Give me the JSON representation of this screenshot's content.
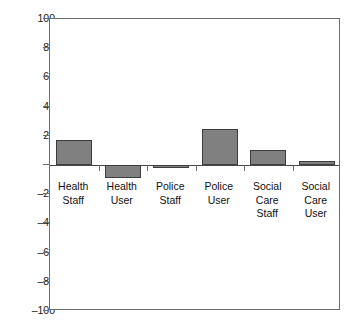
{
  "chart_data": {
    "type": "bar",
    "title": "",
    "subtitle": "",
    "xlabel": "",
    "ylabel": "",
    "categories": [
      "Health Staff",
      "Health User",
      "Police Staff",
      "Police User",
      "Social Care Staff",
      "Social Care User"
    ],
    "category_lines": [
      [
        "Health",
        "Staff"
      ],
      [
        "Health",
        "User"
      ],
      [
        "Police",
        "Staff"
      ],
      [
        "Police",
        "User"
      ],
      [
        "Social",
        "Care",
        "Staff"
      ],
      [
        "Social",
        "Care",
        "User"
      ]
    ],
    "values": [
      17,
      -9,
      -2,
      25,
      10,
      3
    ],
    "ylim": [
      -100,
      100
    ],
    "yticks": [
      100,
      80,
      60,
      40,
      20,
      0,
      -20,
      -40,
      -60,
      -80,
      -100
    ],
    "ytick_labels": [
      "100",
      "80",
      "60",
      "40",
      "20",
      "0",
      "–20",
      "–40",
      "–60",
      "–80",
      "–100"
    ],
    "grid": false,
    "legend": false,
    "legend_position": "none",
    "series": [
      {
        "name": "",
        "values": [
          17,
          -9,
          -2,
          25,
          10,
          3
        ]
      }
    ]
  },
  "style": {
    "bar_fill": "#808080",
    "bar_border": "#3d3d3d",
    "axis_color": "#6e6e6e",
    "zero_line_color": "#4a4a4a",
    "text_color": "#111111",
    "background": "#ffffff"
  }
}
